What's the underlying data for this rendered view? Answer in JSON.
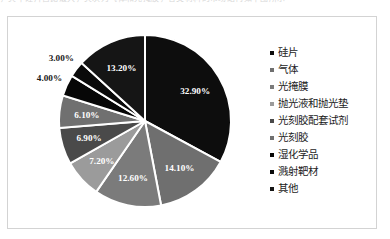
{
  "page": {
    "cut_off_text_above": "，其中硅片占比最大，其次为气体和光掩膜，各类材料的市场结构如下图所示"
  },
  "chart_data": {
    "type": "pie",
    "title": "",
    "subtitle": "",
    "start_angle_deg": 0,
    "direction": "clockwise",
    "legend_position": "right",
    "grid": false,
    "categories": [
      "硅片",
      "气体",
      "光掩膜",
      "抛光液和抛光垫",
      "光刻胶配套试剂",
      "光刻胶",
      "湿化学品",
      "溅射靶材",
      "其他"
    ],
    "values": [
      32.9,
      14.1,
      12.6,
      7.2,
      6.9,
      6.1,
      4.0,
      3.0,
      13.2
    ],
    "value_labels": [
      "32.90%",
      "14.10%",
      "12.60%",
      "7.20%",
      "6.90%",
      "6.10%",
      "4.00%",
      "3.00%",
      "13.20%"
    ],
    "colors": [
      "#0d0d0d",
      "#6f6f6f",
      "#7b7b7b",
      "#9b9b9b",
      "#4a4a4a",
      "#707070",
      "#070707",
      "#0a0a0a",
      "#151515"
    ],
    "label_text_colors": [
      "#ffffff",
      "#ffffff",
      "#ffffff",
      "#ffffff",
      "#ffffff",
      "#ffffff",
      "#1a1a1a",
      "#1a1a1a",
      "#ffffff"
    ],
    "label_placement": [
      "inside",
      "inside",
      "inside",
      "inside",
      "inside",
      "inside",
      "outside",
      "outside",
      "inside"
    ],
    "slice_separator_color": "#ffffff",
    "unit": "%"
  },
  "legend": {
    "items": [
      {
        "label": "硅片",
        "color": "#0d0d0d"
      },
      {
        "label": "气体",
        "color": "#6f6f6f"
      },
      {
        "label": "光掩膜",
        "color": "#7b7b7b"
      },
      {
        "label": "抛光液和抛光垫",
        "color": "#9b9b9b"
      },
      {
        "label": "光刻胶配套试剂",
        "color": "#4a4a4a"
      },
      {
        "label": "光刻胶",
        "color": "#707070"
      },
      {
        "label": "湿化学品",
        "color": "#070707"
      },
      {
        "label": "溅射靶材",
        "color": "#0a0a0a"
      },
      {
        "label": "其他",
        "color": "#151515"
      }
    ]
  }
}
